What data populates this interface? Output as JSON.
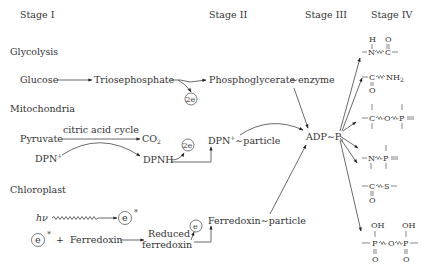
{
  "stages": [
    "Stage I",
    "Stage II",
    "Stage III",
    "Stage IV"
  ],
  "sections": {
    "glycolysis": {
      "title": "Glycolysis",
      "glucose": "Glucose",
      "triosephosphate": "Triosephosphate",
      "phosphoglycerate": "Phosphoglycerate",
      "enzyme": "∼enzyme",
      "electrons": "2e"
    },
    "mitochondria": {
      "title": "Mitochondria",
      "cycle": "citric acid cycle",
      "pyruvate": "Pyruvate",
      "co2": "CO",
      "co2_sub": "2",
      "dpn": "DPN",
      "dpn_sup": "+",
      "dpnh": "DPNH",
      "electrons": "2e",
      "dpn_particle": "DPN",
      "dpn_particle_sup": "+",
      "particle": "∼particle"
    },
    "chloroplast": {
      "title": "Chloroplast",
      "hv": "hν",
      "electron": "e",
      "star": "*",
      "plus": "+",
      "ferredoxin": "Ferredoxin",
      "reduced_1": "Reduced",
      "reduced_2": "ferredoxin",
      "ferredoxin_particle": "Ferredoxin",
      "particle": "∼particle"
    }
  },
  "central": {
    "adp": "ADP",
    "tilde": "∼",
    "p": "P",
    "p_sub": "i"
  },
  "products": [
    {
      "name": "amide-bond",
      "atoms": [
        "H",
        "N",
        "C",
        "O"
      ]
    },
    {
      "name": "carbamoyl",
      "atoms": [
        "C",
        "NH",
        "2",
        "O"
      ]
    },
    {
      "name": "acyl-phosphate",
      "atoms": [
        "C",
        "O",
        "P"
      ]
    },
    {
      "name": "phosphoramide",
      "atoms": [
        "N",
        "P"
      ]
    },
    {
      "name": "thioester",
      "atoms": [
        "C",
        "S",
        "O"
      ]
    },
    {
      "name": "pyrophosphate",
      "atoms": [
        "OH",
        "P",
        "O",
        "P",
        "OH",
        "O",
        "O"
      ]
    }
  ]
}
